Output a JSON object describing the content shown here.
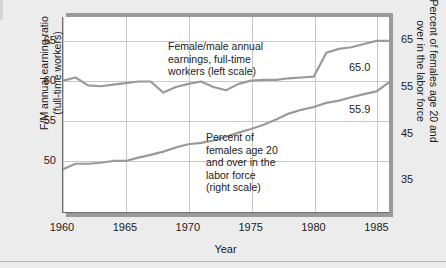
{
  "chart_data": {
    "type": "line",
    "title": "",
    "xlabel": "Year",
    "grid": true,
    "legend_position": "in-plot annotations",
    "x": [
      1960,
      1961,
      1962,
      1963,
      1964,
      1965,
      1966,
      1967,
      1968,
      1969,
      1970,
      1971,
      1972,
      1973,
      1974,
      1975,
      1976,
      1977,
      1978,
      1979,
      1980,
      1981,
      1982,
      1983,
      1984,
      1985,
      1986
    ],
    "xlim": [
      1960,
      1986
    ],
    "xticks": [
      1960,
      1965,
      1970,
      1975,
      1980,
      1985
    ],
    "left_axis": {
      "label": "F/M annual earning ratio\n(full-time workers)",
      "ticks": [
        50,
        55,
        60,
        65
      ],
      "lim": [
        43.5,
        68.0
      ]
    },
    "right_axis": {
      "label": "Percent of females age 20 and\nover in the labor force",
      "ticks": [
        35,
        45,
        55,
        65
      ],
      "lim": [
        28.0,
        70.0
      ]
    },
    "series": [
      {
        "name": "Female/male annual earnings, full-time workers (left scale)",
        "axis": "left",
        "color": "#9a9a9b",
        "end_label": "65.0",
        "values": [
          60.0,
          60.4,
          59.4,
          59.3,
          59.5,
          59.7,
          59.9,
          59.9,
          58.5,
          59.2,
          59.6,
          59.9,
          59.2,
          58.8,
          59.6,
          60.0,
          60.1,
          60.1,
          60.3,
          60.4,
          60.5,
          63.5,
          64.0,
          64.2,
          64.6,
          65.0,
          65.0
        ]
      },
      {
        "name": "Percent of females age 20 and over in the labor force (right scale)",
        "axis": "right",
        "color": "#9a9a9b",
        "end_label": "55.9",
        "values": [
          37.2,
          38.4,
          38.4,
          38.6,
          39.0,
          39.0,
          39.7,
          40.3,
          41.0,
          41.9,
          42.6,
          42.9,
          43.4,
          44.2,
          45.1,
          45.9,
          46.8,
          47.9,
          49.2,
          50.0,
          50.6,
          51.5,
          52.0,
          52.7,
          53.4,
          54.0,
          55.9
        ]
      }
    ],
    "annotations": [
      {
        "id": "earnings-annotation",
        "text": "Female/male annual\nearnings, full-time\nworkers (left scale)"
      },
      {
        "id": "labor-force-annotation",
        "text": "Percent of\nfemales age 20\nand over in the\nlabor force\n(right scale)"
      }
    ]
  }
}
